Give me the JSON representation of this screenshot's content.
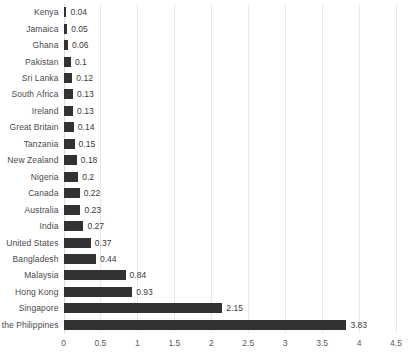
{
  "chart_data": {
    "type": "bar",
    "orientation": "horizontal",
    "title": "",
    "subtitle": "",
    "xlabel": "",
    "ylabel": "",
    "xlim": [
      0,
      4.5
    ],
    "xticks": [
      0,
      0.5,
      1,
      1.5,
      2,
      2.5,
      3,
      3.5,
      4,
      4.5
    ],
    "xtick_labels": [
      "0",
      "0.5",
      "1",
      "1.5",
      "2",
      "2.5",
      "3",
      "3.5",
      "4",
      "4.5"
    ],
    "grid": "vertical",
    "legend": "none",
    "bar_color": "#323232",
    "gridline_color": "#e8e8e8",
    "categories": [
      "Kenya",
      "Jamaica",
      "Ghana",
      "Pakistan",
      "Sri Lanka",
      "South Africa",
      "Ireland",
      "Great Britain",
      "Tanzania",
      "New Zealand",
      "Nigeria",
      "Canada",
      "Australia",
      "India",
      "United States",
      "Bangladesh",
      "Malaysia",
      "Hong Kong",
      "Singapore",
      "the Philippines"
    ],
    "values": [
      0.04,
      0.05,
      0.06,
      0.1,
      0.12,
      0.13,
      0.13,
      0.14,
      0.15,
      0.18,
      0.2,
      0.22,
      0.23,
      0.27,
      0.37,
      0.44,
      0.84,
      0.93,
      2.15,
      3.83
    ],
    "value_labels": [
      "0.04",
      "0.05",
      "0.06",
      "0.1",
      "0.12",
      "0.13",
      "0.13",
      "0.14",
      "0.15",
      "0.18",
      "0.2",
      "0.22",
      "0.23",
      "0.27",
      "0.37",
      "0.44",
      "0.84",
      "0.93",
      "2.15",
      "3.83"
    ]
  }
}
